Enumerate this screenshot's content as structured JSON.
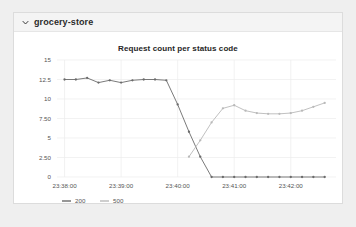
{
  "panel": {
    "title": "grocery-store",
    "collapse_icon": "chevron-down-icon",
    "expanded": true
  },
  "chart_data": {
    "type": "line",
    "title": "Request count per status code",
    "xlabel": "",
    "ylabel": "",
    "grid": true,
    "legend_position": "bottom-left",
    "x_tick_labels": [
      "23:38:00",
      "23:39:00",
      "23:40:00",
      "23:41:00",
      "23:42:00"
    ],
    "x_tick_values": [
      0,
      60,
      120,
      180,
      240
    ],
    "y_tick_labels": [
      "0",
      "2.50",
      "5",
      "7.50",
      "10",
      "12.5",
      "15"
    ],
    "y_tick_values": [
      0,
      2.5,
      5,
      7.5,
      10,
      12.5,
      15
    ],
    "xlim": [
      -8,
      288
    ],
    "ylim": [
      0,
      15
    ],
    "colors": {
      "200": "#6b6b6b",
      "500": "#b9b9b9"
    },
    "series": [
      {
        "name": "200",
        "color": "#6b6b6b",
        "x": [
          0,
          12,
          24,
          36,
          48,
          60,
          72,
          84,
          96,
          108,
          120,
          132,
          144,
          156,
          168,
          180,
          192,
          204,
          216,
          228,
          240,
          252,
          264,
          276
        ],
        "values": [
          12.5,
          12.5,
          12.7,
          12.1,
          12.4,
          12.1,
          12.4,
          12.5,
          12.5,
          12.4,
          9.3,
          5.8,
          2.6,
          0,
          0,
          0,
          0,
          0,
          0,
          0,
          0,
          0,
          0,
          0
        ]
      },
      {
        "name": "500",
        "color": "#b9b9b9",
        "x": [
          132,
          144,
          156,
          168,
          180,
          192,
          204,
          216,
          228,
          240,
          252,
          264,
          276
        ],
        "values": [
          2.6,
          4.7,
          7.0,
          8.8,
          9.2,
          8.5,
          8.2,
          8.1,
          8.1,
          8.2,
          8.5,
          9.0,
          9.5
        ]
      }
    ]
  },
  "legend": {
    "items": [
      {
        "label": "200",
        "color": "#6b6b6b"
      },
      {
        "label": "500",
        "color": "#b9b9b9"
      }
    ]
  }
}
